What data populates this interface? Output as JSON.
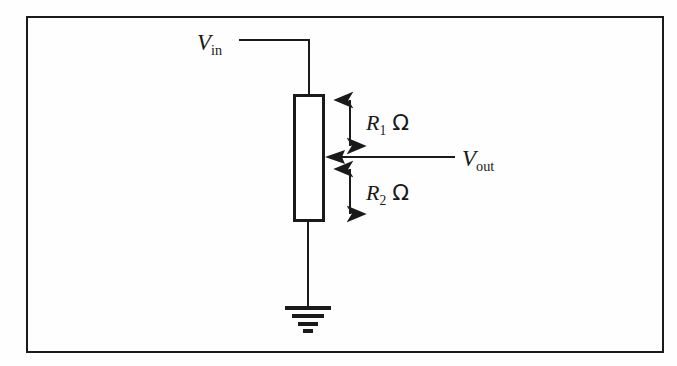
{
  "figure": {
    "type": "circuit-diagram",
    "width": 677,
    "height": 366,
    "background_color": "#fefefe",
    "line_color": "#1a1a1a",
    "border": {
      "x": 26,
      "y": 16,
      "width": 638,
      "height": 337,
      "stroke_width": 2
    }
  },
  "labels": {
    "v_in": {
      "symbol": "V",
      "subscript": "in",
      "x": 197,
      "y": 50,
      "font_size": 23
    },
    "v_out": {
      "symbol": "V",
      "subscript": "out",
      "x": 462,
      "y": 166,
      "font_size": 23
    },
    "r1": {
      "symbol": "R",
      "subscript": "1",
      "unit": "Ω",
      "x": 366,
      "y": 130,
      "font_size": 22
    },
    "r2": {
      "symbol": "R",
      "subscript": "2",
      "unit": "Ω",
      "x": 366,
      "y": 200,
      "font_size": 22
    }
  },
  "components": {
    "resistor": {
      "name": "potentiometer-body",
      "x": 294,
      "y": 95,
      "width": 29,
      "height": 125,
      "stroke_width": 3
    },
    "ground": {
      "name": "ground-symbol",
      "center_x": 308,
      "stem_top": 220,
      "stem_bottom": 308,
      "bars": [
        {
          "y": 308,
          "half_width": 23,
          "thickness": 3.5
        },
        {
          "y": 316,
          "half_width": 16,
          "thickness": 3.5
        },
        {
          "y": 324,
          "half_width": 10,
          "thickness": 3.5
        },
        {
          "y": 331,
          "half_width": 5,
          "thickness": 3.5
        }
      ]
    }
  },
  "wires": {
    "input_horizontal": {
      "x1": 240,
      "y1": 40,
      "x2": 309,
      "y2": 40
    },
    "input_vertical": {
      "x1": 309,
      "y1": 40,
      "x2": 309,
      "y2": 95
    },
    "output_horizontal": {
      "x1": 330,
      "y1": 157,
      "x2": 455,
      "y2": 157
    },
    "ground_stem": {
      "x1": 308,
      "y1": 220,
      "x2": 308,
      "y2": 308
    }
  },
  "dimension_arrows": {
    "r1_span": {
      "x": 350,
      "y_top": 94,
      "y_bottom": 151,
      "label": "R1"
    },
    "r2_span": {
      "x": 350,
      "y_top": 163,
      "y_bottom": 219,
      "label": "R2"
    },
    "tap_pointer": {
      "x_tail": 392,
      "x_head": 326,
      "y": 157
    }
  }
}
